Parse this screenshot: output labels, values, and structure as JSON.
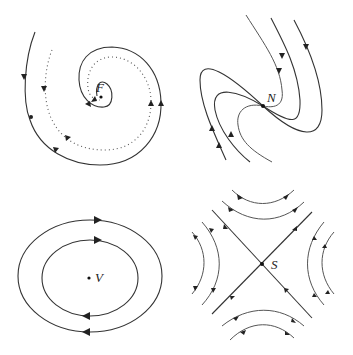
{
  "figure": {
    "panels": [
      {
        "id": "focus",
        "label": "F",
        "type": "stable focus (spiral)",
        "position": "top-left"
      },
      {
        "id": "node",
        "label": "N",
        "type": "node",
        "position": "top-right"
      },
      {
        "id": "vortex",
        "label": "V",
        "type": "center (vortex)",
        "position": "bottom-left"
      },
      {
        "id": "saddle",
        "label": "S",
        "type": "saddle",
        "position": "bottom-right"
      }
    ]
  }
}
